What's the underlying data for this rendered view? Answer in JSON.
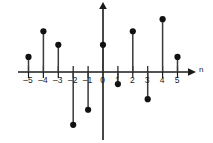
{
  "chart_data": {
    "type": "scatter",
    "subtype": "stem",
    "title": "",
    "subtitle": "",
    "xlabel": "n",
    "ylabel": "",
    "grid": false,
    "legend": null,
    "xlim": [
      -5.8,
      5.8
    ],
    "ylim": [
      -4.2,
      4.2
    ],
    "x": [
      -5,
      -4,
      -3,
      -2,
      -1,
      0,
      1,
      2,
      3,
      4,
      5
    ],
    "values": [
      1.0,
      2.7,
      1.8,
      -3.5,
      -2.5,
      1.8,
      -0.8,
      2.7,
      -1.8,
      3.5,
      1.0
    ],
    "tick_labels": [
      "–5",
      "–4",
      "–3",
      "–2",
      "–1",
      "0",
      "1",
      "2",
      "3",
      "4",
      "5"
    ],
    "points": [
      {
        "n": -5,
        "label": "–5",
        "value": 1.0
      },
      {
        "n": -4,
        "label": "–4",
        "value": 2.7
      },
      {
        "n": -3,
        "label": "–3",
        "value": 1.8
      },
      {
        "n": -2,
        "label": "–2",
        "value": -3.5
      },
      {
        "n": -1,
        "label": "–1",
        "value": -2.5
      },
      {
        "n": 0,
        "label": "0",
        "value": 1.8
      },
      {
        "n": 1,
        "label": "1",
        "value": -0.8
      },
      {
        "n": 2,
        "label": "2",
        "value": 2.7
      },
      {
        "n": 3,
        "label": "3",
        "value": -1.8
      },
      {
        "n": 4,
        "label": "4",
        "value": 3.5
      },
      {
        "n": 5,
        "label": "5",
        "value": 1.0
      }
    ]
  },
  "axes": {
    "horizontal_axis_name": "n",
    "vertical_axis_name": "",
    "horizontal_arrow": "arrow-right",
    "vertical_arrow": "arrow-up"
  },
  "colors": {
    "axis": "#1a1a1a",
    "stem": "#3a3a3a",
    "marker": "#111111",
    "background": "#ffffff",
    "text": "#1a1a1a"
  }
}
